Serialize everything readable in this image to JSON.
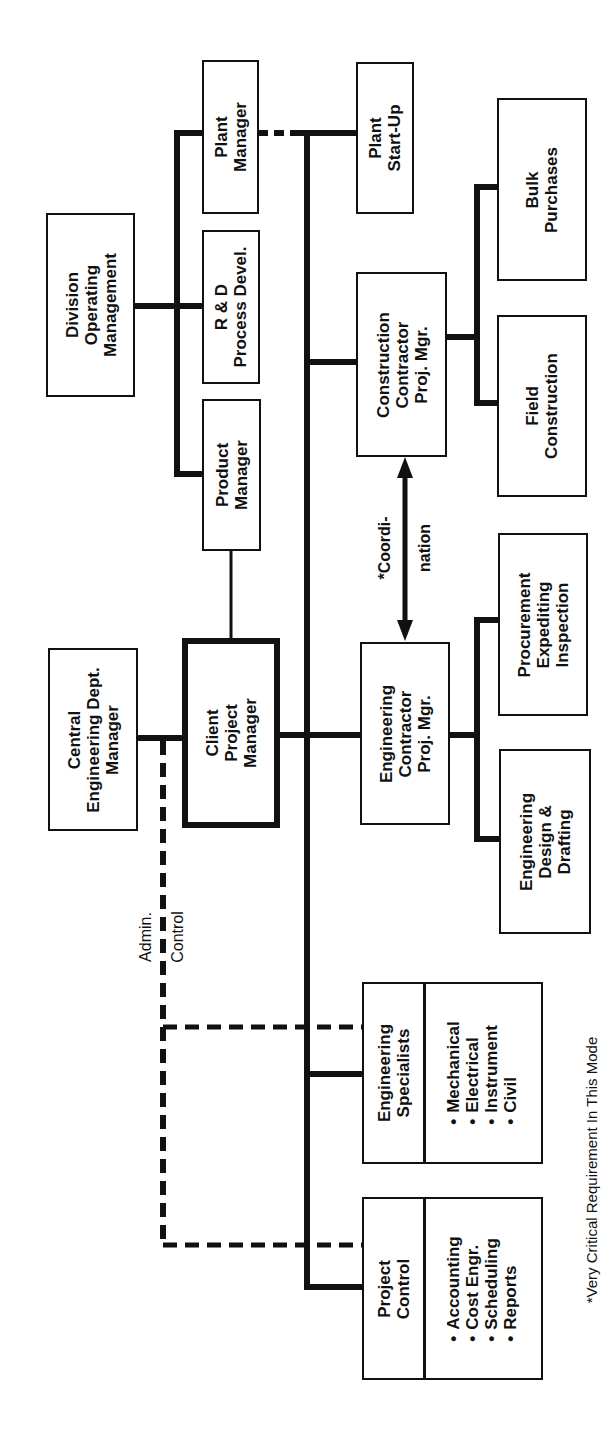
{
  "diagram": {
    "orientation": "rotated-90-ccw",
    "boxes": {
      "division_operating_management": [
        "Division",
        "Operating",
        "Management"
      ],
      "plant_manager": [
        "Plant",
        "Manager"
      ],
      "rd_process_devel": [
        "R & D",
        "Process Devel."
      ],
      "product_manager": [
        "Product",
        "Manager"
      ],
      "central_engineering_dept_manager": [
        "Central",
        "Engineering Dept.",
        "Manager"
      ],
      "client_project_manager": [
        "Client",
        "Project",
        "Manager"
      ],
      "plant_start_up": [
        "Plant",
        "Start-Up"
      ],
      "construction_contractor_proj_mgr": [
        "Construction",
        "Contractor",
        "Proj. Mgr."
      ],
      "engineering_contractor_proj_mgr": [
        "Engineering",
        "Contractor",
        "Proj. Mgr."
      ],
      "bulk_purchases": [
        "Bulk",
        "Purchases"
      ],
      "field_construction": [
        "Field",
        "Construction"
      ],
      "procurement_expediting_inspection": [
        "Procurement",
        "Expediting",
        "Inspection"
      ],
      "engineering_design_drafting": [
        "Engineering",
        "Design &",
        "Drafting"
      ],
      "engineering_specialists": {
        "title": [
          "Engineering",
          "Specialists"
        ],
        "items": [
          "Mechanical",
          "Electrical",
          "Instrument",
          "Civil"
        ]
      },
      "project_control": {
        "title": [
          "Project",
          "Control"
        ],
        "items": [
          "Accounting",
          "Cost Engr.",
          "Scheduling",
          "Reports"
        ]
      }
    },
    "annotations": {
      "coordination": [
        "*Coordi-",
        "nation"
      ],
      "admin_control": [
        "Admin.",
        "Control"
      ]
    },
    "footnote": "*Very Critical Requirement In This Mode",
    "line_color": "#111111",
    "background": "#ffffff"
  }
}
